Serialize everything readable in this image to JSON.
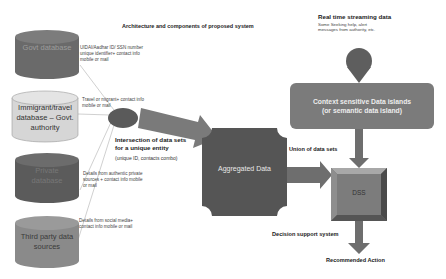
{
  "title": "Architecture and components of proposed system",
  "sources": [
    {
      "id": "govt",
      "label": "Govt database",
      "color": "#6b6b6b",
      "text_color": "#9a9a9a",
      "note": "UIDAI/Aadhar ID/ SSN number unique identifier+ contact info mobile or mail"
    },
    {
      "id": "immigrant",
      "label": "Immigrant/travel database – Govt. authority",
      "color": "#d9d9d9",
      "text_color": "#333333",
      "note": "Travel or migrant+ contact info mobile or mail"
    },
    {
      "id": "private",
      "label": "Private database",
      "color": "#5e5e5e",
      "text_color": "#7a7a7a",
      "note": "Details from authentic private sources + contact info mobile or mail"
    },
    {
      "id": "third",
      "label": "Third party data sources",
      "color": "#8c8c8c",
      "text_color": "#3a3a3a",
      "note": "Details from social media+ contact info mobile or mail"
    }
  ],
  "intersection": {
    "title_line1": "Intersection of data sets",
    "title_line2": "for a unique entity",
    "subtitle": "(unique ID, contacts combo)"
  },
  "aggregated": {
    "label": "Aggregated Data"
  },
  "streaming": {
    "title": "Real time streaming data",
    "subtitle_line1": "Some Seeking help, alert",
    "subtitle_line2": "messages from authority, etc."
  },
  "context_island": {
    "line1": "Context sensitive Data islands",
    "line2": "(or semantic data island)"
  },
  "union_label": "Union of data sets",
  "dss": {
    "label": "DSS"
  },
  "dss_caption": "Decision support system",
  "output_label": "Recommended Action",
  "colors": {
    "dark_shape": "#5a5a5a",
    "mid_shape": "#7a7a7a",
    "light_shape": "#d9d9d9",
    "arrow": "#7f7f7f",
    "line": "#b5b5b5"
  }
}
